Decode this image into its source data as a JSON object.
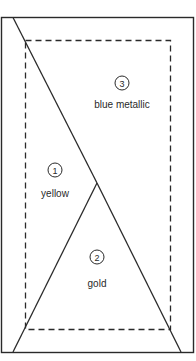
{
  "diagram": {
    "stroke_color": "#2a2a2a",
    "regions": [
      {
        "number": "1",
        "label": "yellow"
      },
      {
        "number": "2",
        "label": "gold"
      },
      {
        "number": "3",
        "label": "blue metallic"
      }
    ]
  }
}
